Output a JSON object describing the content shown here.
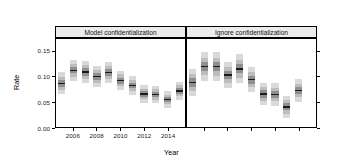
{
  "figure": {
    "axis_titles": {
      "x": "Year",
      "y": "Rate"
    },
    "y_ticks": [
      "0.00",
      "0.05",
      "0.10",
      "0.15"
    ],
    "x_ticks_bottom": [
      "2006",
      "2008",
      "2010",
      "2012",
      "2014"
    ],
    "x_ticks_top": [
      "2006",
      "2008",
      "2010",
      "2012",
      "2014"
    ],
    "panels": [
      {
        "label": "Model confidentialization"
      },
      {
        "label": "Ignore confidentialization"
      }
    ],
    "colors": {
      "band_95": "#d9d9d9",
      "band_80": "#bdbdbd",
      "band_50": "#8f8f8f",
      "median": "#1a1a1a",
      "strip_fill": "#ececec",
      "frame": "#000000",
      "background": "#ffffff"
    }
  },
  "chart_data": {
    "type": "bar",
    "title": "",
    "subtitle": "",
    "xlabel": "Year",
    "ylabel": "Rate",
    "ylim": [
      0.0,
      0.175
    ],
    "xlim": [
      2004.5,
      2015.5
    ],
    "grid": false,
    "legend": "none",
    "layout": "two panels side by side, shared y axis; left panel x-axis ticks on bottom, right panel x-axis ticks on top",
    "y_ticks": [
      0.0,
      0.05,
      0.1,
      0.15
    ],
    "x_ticks": [
      2006,
      2008,
      2010,
      2012,
      2014
    ],
    "encoding": "fan / interval plot: outer light-grey = 95% interval, mid grey = 80% interval, dark grey = 50% interval, black line = median",
    "categories": [
      2005,
      2006,
      2007,
      2008,
      2009,
      2010,
      2011,
      2012,
      2013,
      2014,
      2015
    ],
    "panels": [
      {
        "name": "Model confidentialization",
        "series": [
          {
            "name": "median",
            "values": [
              0.089,
              0.114,
              0.111,
              0.102,
              0.11,
              0.094,
              0.084,
              0.068,
              0.067,
              0.057,
              0.074
            ]
          },
          {
            "name": "q25",
            "values": [
              0.082,
              0.108,
              0.104,
              0.096,
              0.103,
              0.088,
              0.079,
              0.063,
              0.062,
              0.052,
              0.069
            ]
          },
          {
            "name": "q75",
            "values": [
              0.096,
              0.121,
              0.118,
              0.109,
              0.117,
              0.1,
              0.09,
              0.073,
              0.072,
              0.062,
              0.08
            ]
          },
          {
            "name": "q10",
            "values": [
              0.076,
              0.102,
              0.098,
              0.09,
              0.097,
              0.083,
              0.074,
              0.058,
              0.057,
              0.048,
              0.064
            ]
          },
          {
            "name": "q90",
            "values": [
              0.102,
              0.127,
              0.124,
              0.115,
              0.123,
              0.106,
              0.095,
              0.078,
              0.077,
              0.067,
              0.085
            ]
          },
          {
            "name": "q2.5",
            "values": [
              0.068,
              0.094,
              0.09,
              0.082,
              0.089,
              0.076,
              0.067,
              0.051,
              0.05,
              0.041,
              0.057
            ]
          },
          {
            "name": "q97.5",
            "values": [
              0.11,
              0.135,
              0.132,
              0.123,
              0.131,
              0.113,
              0.103,
              0.085,
              0.084,
              0.074,
              0.092
            ]
          }
        ]
      },
      {
        "name": "Ignore confidentialization",
        "series": [
          {
            "name": "median",
            "values": [
              0.09,
              0.122,
              0.121,
              0.105,
              0.117,
              0.096,
              0.068,
              0.067,
              0.043,
              0.075,
              null
            ]
          },
          {
            "name": "q25",
            "values": [
              0.081,
              0.113,
              0.112,
              0.097,
              0.108,
              0.088,
              0.061,
              0.06,
              0.036,
              0.068,
              null
            ]
          },
          {
            "name": "q75",
            "values": [
              0.099,
              0.131,
              0.13,
              0.113,
              0.126,
              0.104,
              0.075,
              0.074,
              0.05,
              0.082,
              null
            ]
          },
          {
            "name": "q10",
            "values": [
              0.074,
              0.105,
              0.104,
              0.09,
              0.1,
              0.081,
              0.055,
              0.054,
              0.03,
              0.062,
              null
            ]
          },
          {
            "name": "q90",
            "values": [
              0.106,
              0.139,
              0.138,
              0.12,
              0.134,
              0.111,
              0.081,
              0.08,
              0.056,
              0.088,
              null
            ]
          },
          {
            "name": "q2.5",
            "values": [
              0.064,
              0.094,
              0.093,
              0.08,
              0.089,
              0.071,
              0.046,
              0.045,
              0.021,
              0.053,
              null
            ]
          },
          {
            "name": "q97.5",
            "values": [
              0.116,
              0.15,
              0.149,
              0.13,
              0.145,
              0.121,
              0.09,
              0.089,
              0.065,
              0.097,
              null
            ]
          }
        ]
      }
    ]
  }
}
